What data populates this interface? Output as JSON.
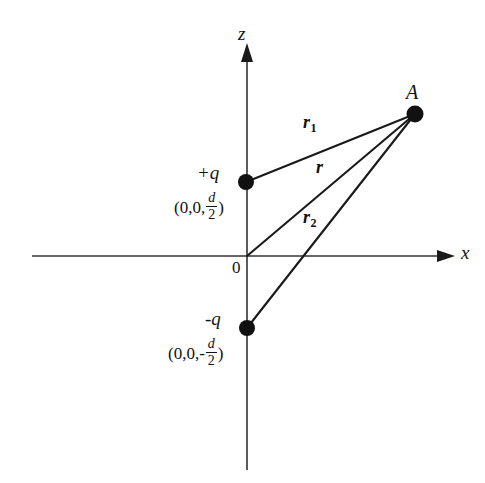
{
  "figure": {
    "background_color": "#ffffff",
    "ink_color": "#111111"
  },
  "axes": {
    "z_label": "z",
    "x_label": "x",
    "origin_label": "0",
    "x_axis": {
      "x1": 32,
      "y1": 256,
      "x2": 452,
      "y2": 256,
      "arrow_at": "end"
    },
    "z_axis": {
      "x1": 247,
      "y1": 470,
      "x2": 247,
      "y2": 45,
      "arrow_at": "end"
    },
    "z_label_pos": {
      "x": 238,
      "y": 24
    },
    "x_label_pos": {
      "x": 461,
      "y": 243
    },
    "origin_label_pos": {
      "x": 232,
      "y": 259
    }
  },
  "points": [
    {
      "name": "field-point",
      "label": "A",
      "x": 415,
      "y": 114,
      "radius": 8,
      "label_pos": {
        "x": 406,
        "y": 82
      }
    },
    {
      "name": "positive-charge",
      "label": "+q",
      "coordinate_prefix": "(0,0,",
      "coordinate_numerator": "d",
      "coordinate_denominator": "2",
      "coordinate_suffix": ")",
      "coordinate_sign": "",
      "x": 246,
      "y": 182,
      "radius": 8,
      "label_pos": {
        "x": 197,
        "y": 163
      },
      "coord_pos": {
        "x": 174,
        "y": 192
      }
    },
    {
      "name": "negative-charge",
      "label": "-q",
      "coordinate_prefix": "(0,0,",
      "coordinate_numerator": "d",
      "coordinate_denominator": "2",
      "coordinate_suffix": ")",
      "coordinate_sign": "-",
      "x": 247,
      "y": 328,
      "radius": 8,
      "label_pos": {
        "x": 205,
        "y": 309
      },
      "coord_pos": {
        "x": 168,
        "y": 338
      }
    }
  ],
  "vectors": [
    {
      "name": "r1",
      "label": "r",
      "subscript": "1",
      "from": {
        "x": 246,
        "y": 182
      },
      "to": {
        "x": 415,
        "y": 114
      },
      "label_pos": {
        "x": 303,
        "y": 123
      }
    },
    {
      "name": "r",
      "label": "r",
      "subscript": "",
      "from": {
        "x": 247,
        "y": 256
      },
      "to": {
        "x": 415,
        "y": 114
      },
      "label_pos": {
        "x": 316,
        "y": 168
      }
    },
    {
      "name": "r2",
      "label": "r",
      "subscript": "2",
      "from": {
        "x": 247,
        "y": 328
      },
      "to": {
        "x": 415,
        "y": 114
      },
      "label_pos": {
        "x": 303,
        "y": 218
      }
    }
  ]
}
